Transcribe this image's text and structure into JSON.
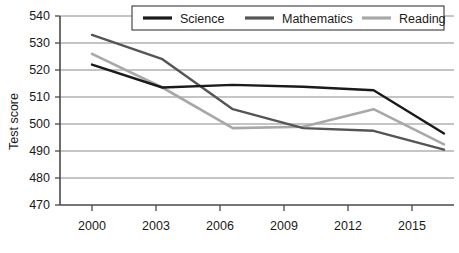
{
  "chart_data": {
    "type": "line",
    "title": "",
    "subtitle": "",
    "xlabel": "",
    "ylabel": "Test score",
    "x": [
      2000,
      2003,
      2006,
      2009,
      2012,
      2015
    ],
    "categories": [
      "2000",
      "2003",
      "2006",
      "2009",
      "2012",
      "2015"
    ],
    "xlim": [
      2000,
      2015
    ],
    "ylim": [
      470,
      540
    ],
    "yticks": [
      470,
      480,
      490,
      500,
      510,
      520,
      530,
      540
    ],
    "ytick_labels": [
      "470",
      "480",
      "490",
      "500",
      "510",
      "520",
      "530",
      "540"
    ],
    "xticks": [
      2000,
      2003,
      2006,
      2009,
      2012,
      2015
    ],
    "xtick_labels": [
      "2000",
      "2003",
      "2006",
      "2009",
      "2012",
      "2015"
    ],
    "grid": "horizontal",
    "legend_position": "top-center",
    "series": [
      {
        "name": "Science",
        "color": "#1a1a1a",
        "values": [
          522,
          513.5,
          514.5,
          513.8,
          512.5,
          496.5
        ]
      },
      {
        "name": "Mathematics",
        "color": "#555555",
        "values": [
          533,
          524,
          505.5,
          498.5,
          497.5,
          490.5
        ]
      },
      {
        "name": "Reading",
        "color": "#a8a8a8",
        "values": [
          526,
          513.5,
          498.5,
          499,
          505.5,
          492.5
        ]
      }
    ]
  },
  "axes": {
    "y_title": "Test score",
    "y_tick_labels": [
      "540",
      "530",
      "520",
      "510",
      "500",
      "490",
      "480",
      "470"
    ],
    "x_tick_labels": [
      "2000",
      "2003",
      "2006",
      "2009",
      "2012",
      "2015"
    ]
  },
  "legend": {
    "items": [
      {
        "label": "Science",
        "color": "#1a1a1a"
      },
      {
        "label": "Mathematics",
        "color": "#555555"
      },
      {
        "label": "Reading",
        "color": "#a8a8a8"
      }
    ]
  }
}
